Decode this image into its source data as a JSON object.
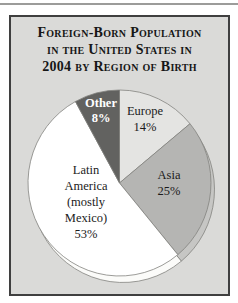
{
  "figure": {
    "top_rule_color": "#9c9c9a",
    "panel_bg": "#dadad8",
    "panel_border_color": "#3f3f3f",
    "title_color": "#161616",
    "title_lines": [
      "Foreign-Born Population",
      "in the United States in",
      "2004 by Region of Birth"
    ]
  },
  "chart_data": {
    "type": "pie",
    "title": "Foreign-Born Population in the United States in 2004 by Region of Birth",
    "direction": "clockwise",
    "start_angle_deg": 0,
    "legend_position": "none",
    "labels_on_chart": true,
    "slices": [
      {
        "label": "Europe",
        "value_pct": 14,
        "fill": "#e4e4e2",
        "depth_color": "#d6d6d4",
        "label_lines": [
          "Europe",
          "14%"
        ],
        "label_color": "#1b1b1b"
      },
      {
        "label": "Asia",
        "value_pct": 25,
        "fill": "#b5b5b3",
        "depth_color": "#c6c6c4",
        "label_lines": [
          "Asia",
          "25%"
        ],
        "label_color": "#1b1b1b"
      },
      {
        "label": "Latin America (mostly Mexico)",
        "value_pct": 53,
        "fill": "#ffffff",
        "depth_color": "#fbfbf9",
        "label_lines": [
          "Latin",
          "America",
          "(mostly",
          "Mexico)",
          "53%"
        ],
        "label_color": "#1b1b1b"
      },
      {
        "label": "Other",
        "value_pct": 8,
        "fill": "#626260",
        "depth_color": "#6e6e6c",
        "label_lines": [
          "Other",
          "8%"
        ],
        "label_color": "#ffffff"
      }
    ],
    "geometry": {
      "cx": 119.5,
      "cy": 183,
      "rx": 91.5,
      "ry": 93,
      "depth_dx": 3.5,
      "depth_dy": 6.5,
      "stroke": "#83837f",
      "stroke_width": 0.8
    }
  }
}
